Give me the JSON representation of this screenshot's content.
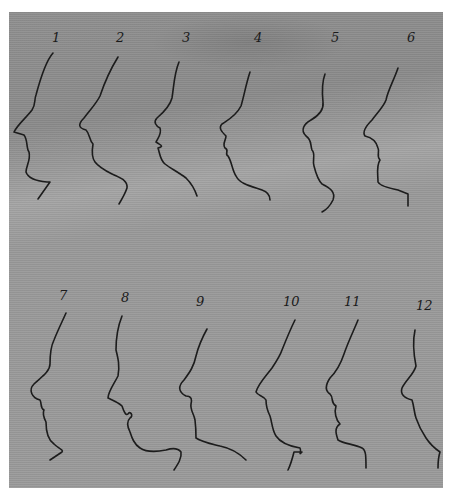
{
  "figure": {
    "background_color": "#959595",
    "ink_color": "#1c1c1c",
    "profiles": [
      {
        "label": "1",
        "x": 52,
        "y": 40
      },
      {
        "label": "2",
        "x": 118,
        "y": 40
      },
      {
        "label": "3",
        "x": 183,
        "y": 40
      },
      {
        "label": "4",
        "x": 255,
        "y": 40
      },
      {
        "label": "5",
        "x": 332,
        "y": 40
      },
      {
        "label": "6",
        "x": 408,
        "y": 40
      },
      {
        "label": "7",
        "x": 62,
        "y": 298
      },
      {
        "label": "8",
        "x": 122,
        "y": 298
      },
      {
        "label": "9",
        "x": 200,
        "y": 302
      },
      {
        "label": "10",
        "x": 287,
        "y": 302
      },
      {
        "label": "11",
        "x": 346,
        "y": 302
      },
      {
        "label": "12",
        "x": 419,
        "y": 306
      }
    ]
  }
}
